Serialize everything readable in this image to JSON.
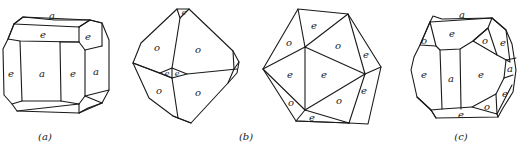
{
  "figure": {
    "panels": [
      {
        "id": "a",
        "caption": "(a)",
        "description": "Cube modified by dodecahedron faces",
        "faces": [
          {
            "label": "a",
            "role": "top"
          },
          {
            "label": "e",
            "role": "top-front"
          },
          {
            "label": "e",
            "role": "top-right"
          },
          {
            "label": "e",
            "role": "left"
          },
          {
            "label": "a",
            "role": "front"
          },
          {
            "label": "e",
            "role": "front-right"
          },
          {
            "label": "a",
            "role": "right"
          }
        ]
      },
      {
        "id": "b",
        "caption": "(b)",
        "description": "Octahedron modified by small dodecahedron faces",
        "faces": [
          {
            "label": "e",
            "role": "apex-top"
          },
          {
            "label": "o",
            "role": "upper-left"
          },
          {
            "label": "o",
            "role": "upper-right"
          },
          {
            "label": "e",
            "role": "center-left"
          },
          {
            "label": "e",
            "role": "center-right"
          },
          {
            "label": "o",
            "role": "lower-left"
          },
          {
            "label": "o",
            "role": "lower-right"
          }
        ]
      },
      {
        "id": "icosahedron",
        "caption": "",
        "description": "Pseudo-icosahedron of octahedron and pyritohedron faces",
        "faces": [
          {
            "label": "e",
            "role": "top"
          },
          {
            "label": "o",
            "role": "upper-left"
          },
          {
            "label": "o",
            "role": "upper-center"
          },
          {
            "label": "e",
            "role": "upper-right"
          },
          {
            "label": "e",
            "role": "mid-left"
          },
          {
            "label": "e",
            "role": "center"
          },
          {
            "label": "e",
            "role": "mid-right"
          },
          {
            "label": "o",
            "role": "lower-left"
          },
          {
            "label": "o",
            "role": "lower-center"
          },
          {
            "label": "e",
            "role": "bottom"
          }
        ]
      },
      {
        "id": "c",
        "caption": "(c)",
        "description": "Combination of cube, octahedron and dodecahedron",
        "faces": [
          {
            "label": "a",
            "role": "top"
          },
          {
            "label": "e",
            "role": "top-front"
          },
          {
            "label": "o",
            "role": "upper-left-corner"
          },
          {
            "label": "o",
            "role": "upper-right-corner"
          },
          {
            "label": "e",
            "role": "upper-right"
          },
          {
            "label": "e",
            "role": "left"
          },
          {
            "label": "a",
            "role": "front"
          },
          {
            "label": "e",
            "role": "front-right"
          },
          {
            "label": "a",
            "role": "right"
          },
          {
            "label": "e",
            "role": "lower-right"
          },
          {
            "label": "o",
            "role": "lower-right-corner"
          },
          {
            "label": "e",
            "role": "bottom"
          }
        ]
      }
    ]
  }
}
